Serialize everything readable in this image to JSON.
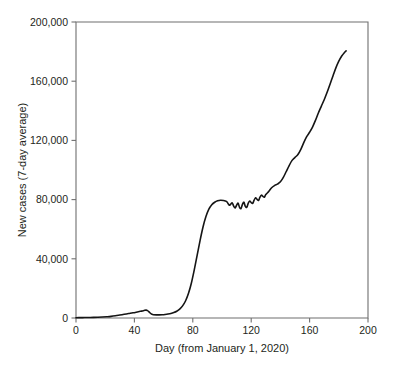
{
  "chart_data": {
    "type": "line",
    "title": "",
    "subtitle": "",
    "xlabel": "Day (from January 1, 2020)",
    "ylabel": "New cases (7-day average)",
    "xlim": [
      0,
      200
    ],
    "ylim": [
      0,
      200000
    ],
    "xticks": [
      0,
      40,
      80,
      120,
      160,
      200
    ],
    "xticklabels": [
      "0",
      "40",
      "80",
      "120",
      "160",
      "200"
    ],
    "yticks": [
      0,
      40000,
      80000,
      120000,
      160000,
      200000
    ],
    "yticklabels": [
      "0",
      "40,000",
      "80,000",
      "120,000",
      "160,000",
      "200,000"
    ],
    "grid": false,
    "legend": null,
    "line_color": "#151515",
    "axis_color": "#6f6f6f",
    "series": [
      {
        "name": "New cases (7-day average)",
        "x": [
          0,
          3,
          6,
          9,
          12,
          15,
          18,
          21,
          24,
          27,
          30,
          33,
          36,
          39,
          42,
          44,
          46,
          47,
          48,
          49,
          50,
          51,
          52,
          53,
          55,
          57,
          59,
          61,
          63,
          65,
          67,
          69,
          71,
          73,
          75,
          77,
          79,
          81,
          83,
          85,
          87,
          89,
          91,
          93,
          95,
          97,
          99,
          101,
          103,
          104,
          105,
          106,
          107,
          108,
          109,
          110,
          111,
          112,
          113,
          114,
          115,
          116,
          117,
          118,
          119,
          120,
          121,
          122,
          123,
          124,
          125,
          126,
          127,
          128,
          129,
          130,
          132,
          134,
          136,
          138,
          140,
          142,
          144,
          146,
          148,
          150,
          152,
          154,
          156,
          158,
          160,
          162,
          164,
          166,
          168,
          170,
          172,
          174,
          176,
          178,
          180,
          182,
          184,
          185
        ],
        "y": [
          200,
          250,
          300,
          350,
          400,
          500,
          650,
          850,
          1100,
          1500,
          2000,
          2500,
          3000,
          3500,
          4100,
          4500,
          4900,
          5200,
          5300,
          5000,
          4200,
          3200,
          2500,
          2200,
          2100,
          2100,
          2200,
          2400,
          2700,
          3100,
          3700,
          4600,
          6000,
          8200,
          11500,
          16500,
          23500,
          32500,
          42500,
          52500,
          61500,
          68500,
          73500,
          76500,
          78200,
          79200,
          79600,
          79400,
          78800,
          77600,
          76200,
          76900,
          77800,
          75600,
          74400,
          76200,
          77600,
          74800,
          73900,
          76800,
          78200,
          75400,
          74800,
          77600,
          79000,
          78000,
          77400,
          79600,
          81200,
          80200,
          79400,
          81600,
          83000,
          82200,
          81600,
          83400,
          85500,
          88000,
          89500,
          90500,
          92000,
          95000,
          99000,
          103000,
          106500,
          108500,
          110500,
          114000,
          118500,
          122500,
          125500,
          129000,
          133500,
          138500,
          143000,
          147500,
          152500,
          158000,
          163500,
          169000,
          173500,
          177000,
          179500,
          180500
        ]
      }
    ]
  },
  "axes": {
    "x_axis_name": "day-axis",
    "y_axis_name": "new-cases-axis"
  }
}
